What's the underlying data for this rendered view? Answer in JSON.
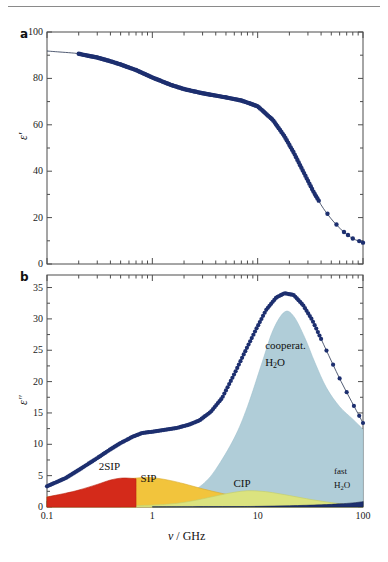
{
  "figure": {
    "panel_a_letter": "a",
    "panel_b_letter": "b",
    "xlabel_symbol": "ν",
    "xlabel_rest": " / GHz",
    "ylabel_a": "ε′",
    "ylabel_b": "ε″"
  },
  "chart_data": [
    {
      "type": "line",
      "panel": "a",
      "title": "",
      "xlabel": "ν / GHz",
      "ylabel": "ε′",
      "xscale": "log",
      "xlim": [
        0.1,
        100
      ],
      "ylim": [
        0,
        100
      ],
      "yticks": [
        0,
        20,
        40,
        60,
        80,
        100
      ],
      "ytick_labels": [
        "0",
        "20",
        "40",
        "60",
        "80",
        "100"
      ],
      "xticks": [
        0.1,
        1,
        10,
        100
      ],
      "xtick_labels": [
        "0.1",
        "1",
        "10",
        "100"
      ],
      "grid": false,
      "legend": "none",
      "series": [
        {
          "name": "ε′ fit curve",
          "color": "#2b3c7a",
          "x": [
            0.1,
            0.13,
            0.17,
            0.2,
            0.3,
            0.4,
            0.5,
            0.7,
            1.0,
            1.5,
            2.0,
            3.0,
            4.0,
            5.0,
            7.0,
            10.0,
            14.0,
            18.0,
            22.0,
            27.0,
            34.0,
            42.0,
            52.0,
            65.0,
            80.0,
            100.0
          ],
          "values": [
            91.8,
            91.4,
            91.0,
            90.6,
            89.0,
            87.4,
            86.0,
            83.6,
            80.4,
            77.2,
            75.4,
            73.6,
            72.6,
            71.8,
            70.5,
            68.0,
            62.0,
            55.0,
            48.0,
            40.0,
            31.0,
            24.0,
            18.5,
            14.0,
            11.0,
            9.2
          ]
        },
        {
          "name": "ε′ measured data",
          "color": "#1d2f6f",
          "marker": "circle",
          "x": [
            0.2,
            0.25,
            0.3,
            0.4,
            0.5,
            0.65,
            0.8,
            1.0,
            1.3,
            1.7,
            2.2,
            2.8,
            3.6,
            4.6,
            6.0,
            7.5,
            9.5,
            12,
            15,
            19,
            24,
            30,
            38,
            48,
            60,
            75,
            90,
            100
          ],
          "values": [
            90.6,
            90.0,
            89.0,
            87.4,
            86.0,
            84.2,
            82.4,
            80.4,
            78.4,
            76.6,
            75.0,
            74.0,
            73.0,
            72.2,
            71.2,
            70.2,
            68.4,
            64.5,
            60.0,
            53.0,
            45.0,
            36.5,
            29.0,
            22.0,
            18.5,
            13.0,
            11.0,
            9.4
          ]
        }
      ]
    },
    {
      "type": "area",
      "panel": "b",
      "title": "",
      "xlabel": "ν / GHz",
      "ylabel": "ε″",
      "xscale": "log",
      "xlim": [
        0.1,
        100
      ],
      "ylim": [
        0,
        37
      ],
      "yticks": [
        0,
        5,
        10,
        15,
        20,
        25,
        30,
        35
      ],
      "ytick_labels": [
        "0",
        "5",
        "10",
        "15",
        "20",
        "25",
        "30",
        "35"
      ],
      "xticks": [
        0.1,
        1,
        10,
        100
      ],
      "xtick_labels": [
        "0.1",
        "1",
        "10",
        "100"
      ],
      "grid": false,
      "legend": "in-plot-annotations",
      "series": [
        {
          "name": "ε″ total measured",
          "color": "#1d2f6f",
          "marker": "circle",
          "x": [
            0.1,
            0.15,
            0.2,
            0.3,
            0.4,
            0.5,
            0.65,
            0.8,
            1.0,
            1.3,
            1.7,
            2.2,
            2.8,
            3.6,
            4.6,
            6.0,
            7.5,
            9.5,
            12,
            15,
            18,
            22,
            27,
            33,
            40,
            50,
            62,
            78,
            100
          ],
          "values": [
            3.3,
            4.6,
            5.9,
            7.8,
            9.2,
            10.2,
            11.2,
            11.8,
            12.0,
            12.3,
            12.6,
            13.1,
            13.8,
            15.2,
            17.4,
            21.2,
            24.6,
            28.1,
            31.4,
            33.4,
            34.1,
            33.8,
            32.2,
            29.8,
            26.8,
            23.3,
            20.0,
            16.8,
            13.4
          ]
        },
        {
          "name": "cooperat. H2O",
          "color": "#b0cdd8",
          "peak_x": 18.0,
          "peak_y": 31.1,
          "x": [
            1.0,
            1.5,
            2.0,
            3.0,
            4.0,
            6.0,
            8.0,
            11.0,
            14.0,
            18.0,
            22.0,
            28.0,
            35.0,
            45.0,
            60.0,
            80.0,
            100.0
          ],
          "values": [
            0.3,
            0.8,
            1.6,
            3.6,
            6.0,
            11.0,
            16.0,
            23.0,
            28.2,
            31.1,
            30.4,
            27.0,
            23.0,
            19.0,
            16.0,
            14.0,
            12.4
          ]
        },
        {
          "name": "SIP",
          "color": "#f2c43c",
          "peak_x": 0.85,
          "peak_y": 4.7,
          "x": [
            0.1,
            0.15,
            0.2,
            0.3,
            0.45,
            0.6,
            0.85,
            1.1,
            1.5,
            2.0,
            3.0,
            4.5,
            7.0,
            11.0,
            18.0,
            30.0,
            50.0,
            100.0
          ],
          "values": [
            1.6,
            2.0,
            2.5,
            3.3,
            4.1,
            4.5,
            4.7,
            4.6,
            4.2,
            3.7,
            2.9,
            2.2,
            1.5,
            1.0,
            0.6,
            0.35,
            0.2,
            0.1
          ]
        },
        {
          "name": "2SIP",
          "color": "#d42a1a",
          "peak_x": 0.5,
          "peak_y": 4.6,
          "x": [
            0.1,
            0.15,
            0.2,
            0.3,
            0.4,
            0.5,
            0.6,
            0.7
          ],
          "values": [
            1.6,
            2.2,
            2.7,
            3.6,
            4.3,
            4.6,
            4.6,
            4.5
          ]
        },
        {
          "name": "CIP",
          "color": "#dbe37f",
          "peak_x": 8.0,
          "peak_y": 2.6,
          "x": [
            0.5,
            1.0,
            1.5,
            2.0,
            3.0,
            4.5,
            6.0,
            8.0,
            11.0,
            15.0,
            22.0,
            32.0,
            50.0,
            75.0,
            100.0
          ],
          "values": [
            0.15,
            0.3,
            0.5,
            0.75,
            1.3,
            1.95,
            2.35,
            2.6,
            2.5,
            2.2,
            1.7,
            1.2,
            0.7,
            0.35,
            0.2
          ]
        },
        {
          "name": "fast H2O",
          "color": "#1d2f6f",
          "peak_x": 100.0,
          "peak_y": 0.8,
          "x": [
            1.0,
            5.0,
            10.0,
            20.0,
            40.0,
            60.0,
            80.0,
            100.0
          ],
          "values": [
            0.02,
            0.06,
            0.1,
            0.2,
            0.35,
            0.5,
            0.65,
            0.85
          ]
        }
      ],
      "annotations": [
        {
          "name": "2SIP",
          "text": "2SIP",
          "x": 0.42,
          "y": 6.2
        },
        {
          "name": "SIP",
          "text": "SIP",
          "x": 1.05,
          "y": 4.3
        },
        {
          "name": "CIP",
          "text": "CIP",
          "x": 8.0,
          "y": 3.5
        },
        {
          "name": "cooperat-h2o-l1",
          "text": "cooperat.",
          "x": 16.0,
          "y": 25.5
        },
        {
          "name": "cooperat-h2o-l2",
          "text": "H₂O",
          "x": 16.0,
          "y": 22.8
        },
        {
          "name": "fast-h2o-l1",
          "text": "fast",
          "x": 72.0,
          "y": 5.2
        },
        {
          "name": "fast-h2o-l2",
          "text": "H₂O",
          "x": 72.0,
          "y": 3.0
        }
      ]
    }
  ],
  "colors": {
    "data_navy": "#1d2f6f",
    "cooperative_water": "#b0cdd8",
    "sip_yellow": "#f2c43c",
    "2sip_red": "#d42a1a",
    "cip_green": "#dbe37f",
    "axis": "#4d4d4d",
    "background": "#ffffff"
  }
}
